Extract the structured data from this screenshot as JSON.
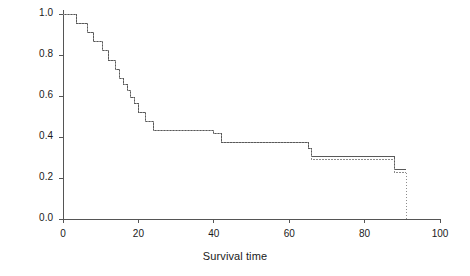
{
  "chart_data": {
    "type": "line",
    "title": "",
    "xlabel": "Survival time",
    "ylabel": "Estimated survivor function",
    "xlim": [
      0,
      100
    ],
    "ylim": [
      0.0,
      1.0
    ],
    "xticks": [
      0,
      20,
      40,
      60,
      80,
      100
    ],
    "xtick_labels": [
      "0",
      "20",
      "40",
      "60",
      "80",
      "100"
    ],
    "yticks": [
      0.0,
      0.2,
      0.4,
      0.6,
      0.8,
      1.0
    ],
    "ytick_labels": [
      "0.0",
      "0.2",
      "0.4",
      "0.6",
      "0.8",
      "1.0"
    ],
    "grid": false,
    "legend": "none",
    "step_style": "post",
    "series": [
      {
        "name": "survivor-curve-solid",
        "style": "solid",
        "color": "#595959",
        "x": [
          0,
          2,
          3.5,
          5,
          6.5,
          8,
          9,
          10.5,
          12,
          13,
          14,
          15,
          16,
          17,
          18,
          19,
          20,
          22,
          24,
          29,
          33,
          36,
          40,
          42,
          47,
          50,
          51,
          62,
          65,
          66,
          79,
          87,
          88,
          91
        ],
        "y": [
          1.0,
          1.0,
          0.955,
          0.955,
          0.91,
          0.865,
          0.865,
          0.82,
          0.775,
          0.775,
          0.73,
          0.685,
          0.655,
          0.625,
          0.595,
          0.565,
          0.52,
          0.475,
          0.43,
          0.43,
          0.43,
          0.43,
          0.415,
          0.375,
          0.375,
          0.375,
          0.375,
          0.375,
          0.345,
          0.305,
          0.305,
          0.305,
          0.24,
          0.24
        ]
      },
      {
        "name": "survivor-curve-dotted",
        "style": "dotted",
        "color": "#8c8c8c",
        "x": [
          0,
          2,
          3.5,
          5,
          6.5,
          8,
          9,
          10.5,
          12,
          13,
          14,
          15,
          16,
          17,
          18,
          19,
          20,
          22,
          24,
          29,
          33,
          36,
          40,
          42,
          47,
          50,
          51,
          62,
          65,
          66,
          79,
          87,
          88,
          91
        ],
        "y": [
          1.0,
          1.0,
          0.955,
          0.955,
          0.91,
          0.865,
          0.865,
          0.82,
          0.775,
          0.775,
          0.73,
          0.685,
          0.655,
          0.625,
          0.595,
          0.565,
          0.52,
          0.475,
          0.43,
          0.43,
          0.43,
          0.43,
          0.415,
          0.375,
          0.375,
          0.375,
          0.375,
          0.375,
          0.345,
          0.29,
          0.29,
          0.29,
          0.225,
          0.225
        ]
      }
    ],
    "annotations": []
  }
}
